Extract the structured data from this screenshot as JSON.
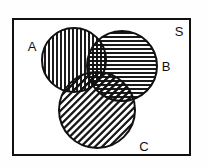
{
  "figure": {
    "type": "venn-diagram",
    "title": "",
    "background_color": "#fefefe",
    "stroke_color": "#111111"
  },
  "universal_set": {
    "label": "S",
    "label_x": 179,
    "label_y": 36,
    "rect": {
      "x": 13,
      "y": 19,
      "width": 177,
      "height": 136
    },
    "border_width": 2
  },
  "sets": [
    {
      "id": "A",
      "label": "A",
      "label_x": 32,
      "label_y": 51,
      "cx": 74,
      "cy": 60,
      "r": 32,
      "fill_pattern": "vertical-lines",
      "pattern_spacing": 4,
      "pattern_angle_deg": 90,
      "stroke_width": 2
    },
    {
      "id": "B",
      "label": "B",
      "label_x": 166,
      "label_y": 71,
      "cx": 122,
      "cy": 66,
      "r": 35,
      "fill_pattern": "horizontal-lines",
      "pattern_spacing": 4,
      "pattern_angle_deg": 0,
      "stroke_width": 2
    },
    {
      "id": "C",
      "label": "C",
      "label_x": 144,
      "label_y": 151,
      "cx": 97,
      "cy": 110,
      "r": 38,
      "fill_pattern": "diagonal-lines",
      "pattern_spacing": 4,
      "pattern_angle_deg": 45,
      "stroke_width": 2
    }
  ],
  "regions": [
    {
      "id": "A-only",
      "shading": "vertical-lines"
    },
    {
      "id": "B-only",
      "shading": "horizontal-lines"
    },
    {
      "id": "C-only",
      "shading": "diagonal-lines"
    },
    {
      "id": "A-and-B",
      "shading": "vertical+horizontal crosshatch"
    },
    {
      "id": "A-and-C",
      "shading": "vertical+diagonal crosshatch"
    },
    {
      "id": "B-and-C",
      "shading": "horizontal+diagonal crosshatch"
    },
    {
      "id": "A-and-B-and-C",
      "shading": "vertical+horizontal+diagonal crosshatch"
    }
  ]
}
